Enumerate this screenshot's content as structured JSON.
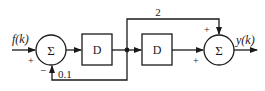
{
  "diagram": {
    "type": "block-diagram",
    "input": {
      "label": "f(k)"
    },
    "output": {
      "label": "y(k)"
    },
    "summers": [
      {
        "id": "sum1",
        "symbol": "Σ",
        "signs": {
          "input": "+",
          "feedback": "−"
        }
      },
      {
        "id": "sum2",
        "symbol": "Σ",
        "signs": {
          "top": "+",
          "left": "+"
        }
      }
    ],
    "blocks": [
      {
        "id": "delay1",
        "label": "D"
      },
      {
        "id": "delay2",
        "label": "D"
      }
    ],
    "gains": {
      "feedback": "0.1",
      "feedforward": "2"
    },
    "colors": {
      "stroke": "#1a1a1a",
      "background": "#ffffff"
    }
  }
}
